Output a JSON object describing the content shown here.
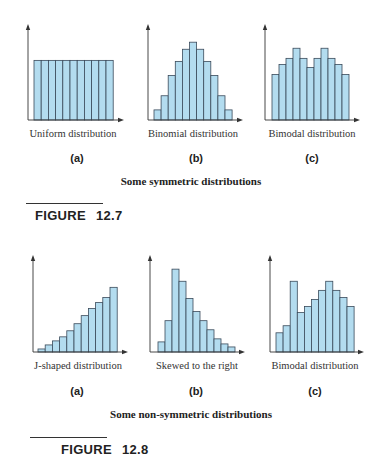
{
  "colors": {
    "bar_fill": "#b3dcef",
    "bar_stroke": "#3a4a5a",
    "axis": "#333333"
  },
  "figures": [
    {
      "caption": "Some symmetric distributions",
      "figure_label": "FIGURE",
      "figure_number": "12.7",
      "panels": [
        {
          "sub": "(a)",
          "title": "Uniform distribution"
        },
        {
          "sub": "(b)",
          "title": "Binomial distribution"
        },
        {
          "sub": "(c)",
          "title": "Bimodal distribution"
        }
      ]
    },
    {
      "caption": "Some non-symmetric distributions",
      "figure_label": "FIGURE",
      "figure_number": "12.8",
      "panels": [
        {
          "sub": "(a)",
          "title": "J-shaped distribution"
        },
        {
          "sub": "(b)",
          "title": "Skewed to the right"
        },
        {
          "sub": "(c)",
          "title": "Bimodal distribution"
        }
      ]
    }
  ],
  "chart_data": [
    {
      "type": "bar",
      "title": "Uniform distribution",
      "panel": "12.7(a)",
      "categories": [
        1,
        2,
        3,
        4,
        5,
        6,
        7,
        8,
        9,
        10,
        11
      ],
      "values": [
        59,
        59,
        59,
        59,
        59,
        59,
        59,
        59,
        59,
        59,
        59
      ],
      "xlabel": "",
      "ylabel": "",
      "ylim": [
        0,
        95
      ],
      "grid": false,
      "axis_ticks": false
    },
    {
      "type": "bar",
      "title": "Binomial distribution",
      "panel": "12.7(b)",
      "categories": [
        1,
        2,
        3,
        4,
        5,
        6,
        7,
        8,
        9,
        10,
        11
      ],
      "values": [
        10,
        24,
        44,
        58,
        70,
        77,
        70,
        58,
        44,
        24,
        10
      ],
      "xlabel": "",
      "ylabel": "",
      "ylim": [
        0,
        95
      ],
      "grid": false,
      "axis_ticks": false
    },
    {
      "type": "bar",
      "title": "Bimodal distribution",
      "panel": "12.7(c)",
      "categories": [
        1,
        2,
        3,
        4,
        5,
        6,
        7,
        8,
        9,
        10,
        11
      ],
      "values": [
        45,
        55,
        61,
        71,
        61,
        52,
        61,
        71,
        61,
        55,
        45
      ],
      "xlabel": "",
      "ylabel": "",
      "ylim": [
        0,
        95
      ],
      "grid": false,
      "axis_ticks": false
    },
    {
      "type": "bar",
      "title": "J-shaped distribution",
      "panel": "12.8(a)",
      "categories": [
        1,
        2,
        3,
        4,
        5,
        6,
        7,
        8,
        9,
        10,
        11
      ],
      "values": [
        3,
        7,
        11,
        15,
        21,
        28,
        36,
        43,
        49,
        54,
        64
      ],
      "xlabel": "",
      "ylabel": "",
      "ylim": [
        0,
        96
      ],
      "grid": false,
      "axis_ticks": false
    },
    {
      "type": "bar",
      "title": "Skewed to the right",
      "panel": "12.8(b)",
      "categories": [
        1,
        2,
        3,
        4,
        5,
        6,
        7,
        8,
        9,
        10,
        11
      ],
      "values": [
        10,
        31,
        82,
        70,
        53,
        40,
        31,
        22,
        13,
        8,
        5
      ],
      "xlabel": "",
      "ylabel": "",
      "ylim": [
        0,
        96
      ],
      "grid": false,
      "axis_ticks": false
    },
    {
      "type": "bar",
      "title": "Bimodal distribution",
      "panel": "12.8(c)",
      "categories": [
        1,
        2,
        3,
        4,
        5,
        6,
        7,
        8,
        9,
        10,
        11
      ],
      "values": [
        19,
        26,
        70,
        39,
        45,
        52,
        61,
        70,
        61,
        54,
        45
      ],
      "xlabel": "",
      "ylabel": "",
      "ylim": [
        0,
        96
      ],
      "grid": false,
      "axis_ticks": false
    }
  ],
  "layout": {
    "panels": [
      {
        "axis_x": 28,
        "base_y": 120,
        "top_y": 24,
        "bar_x0": 34,
        "bar_w": 7.2,
        "end_x": 124
      },
      {
        "axis_x": 148,
        "base_y": 120,
        "top_y": 24,
        "bar_x0": 154,
        "bar_w": 7.1,
        "end_x": 243
      },
      {
        "axis_x": 265,
        "base_y": 120,
        "top_y": 24,
        "bar_x0": 272,
        "bar_w": 7.0,
        "end_x": 360
      },
      {
        "axis_x": 33,
        "base_y": 352,
        "top_y": 255,
        "bar_x0": 38,
        "bar_w": 7.2,
        "end_x": 128
      },
      {
        "axis_x": 150,
        "base_y": 352,
        "top_y": 255,
        "bar_x0": 158,
        "bar_w": 7.0,
        "end_x": 245
      },
      {
        "axis_x": 270,
        "base_y": 352,
        "top_y": 255,
        "bar_x0": 276,
        "bar_w": 7.1,
        "end_x": 364
      }
    ]
  }
}
